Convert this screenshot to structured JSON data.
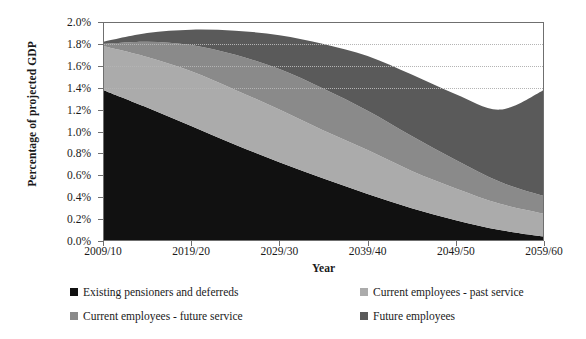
{
  "chart_data": {
    "type": "area",
    "stacked": true,
    "title": "",
    "xlabel": "Year",
    "ylabel": "Percentage of projected GDP",
    "x": [
      2009,
      2014,
      2019,
      2024,
      2029,
      2034,
      2039,
      2044,
      2049,
      2054,
      2059
    ],
    "tick_labels": [
      "2009/10",
      "2019/20",
      "2029/30",
      "2039/40",
      "2049/50",
      "2059/60"
    ],
    "tick_positions": [
      2009,
      2019,
      2029,
      2039,
      2049,
      2059
    ],
    "ylim": [
      0.0,
      2.0
    ],
    "ytick_labels": [
      "0.0%",
      "0.2%",
      "0.4%",
      "0.6%",
      "0.8%",
      "1.0%",
      "1.2%",
      "1.4%",
      "1.6%",
      "1.8%",
      "2.0%"
    ],
    "ytick_values": [
      0.0,
      0.2,
      0.4,
      0.6,
      0.8,
      1.0,
      1.2,
      1.4,
      1.6,
      1.8,
      2.0
    ],
    "grid": "dotted horizontal gridlines at 1.4%, 1.6%, 1.8%",
    "gridline_values": [
      1.4,
      1.6,
      1.8
    ],
    "legend_position": "bottom",
    "series": [
      {
        "name": "Existing pensioners and deferreds",
        "color": "#111111",
        "values": [
          1.38,
          1.22,
          1.05,
          0.88,
          0.72,
          0.57,
          0.43,
          0.3,
          0.19,
          0.1,
          0.04
        ]
      },
      {
        "name": "Current employees - past service",
        "color": "#ababab",
        "values": [
          0.4,
          0.46,
          0.5,
          0.5,
          0.48,
          0.44,
          0.4,
          0.34,
          0.29,
          0.24,
          0.21
        ]
      },
      {
        "name": "Current employees - future service",
        "color": "#8a8a8a",
        "values": [
          0.02,
          0.14,
          0.24,
          0.32,
          0.37,
          0.38,
          0.36,
          0.32,
          0.26,
          0.2,
          0.16
        ]
      },
      {
        "name": "Future employees",
        "color": "#5a5a5a",
        "values": [
          0.02,
          0.08,
          0.14,
          0.22,
          0.31,
          0.41,
          0.5,
          0.56,
          0.6,
          0.66,
          0.97
        ]
      }
    ],
    "totals": [
      1.82,
      1.9,
      1.93,
      1.92,
      1.88,
      1.8,
      1.69,
      1.52,
      1.34,
      1.2,
      1.38
    ]
  },
  "axis": {
    "y_title": "Percentage of projected GDP",
    "x_title": "Year"
  }
}
